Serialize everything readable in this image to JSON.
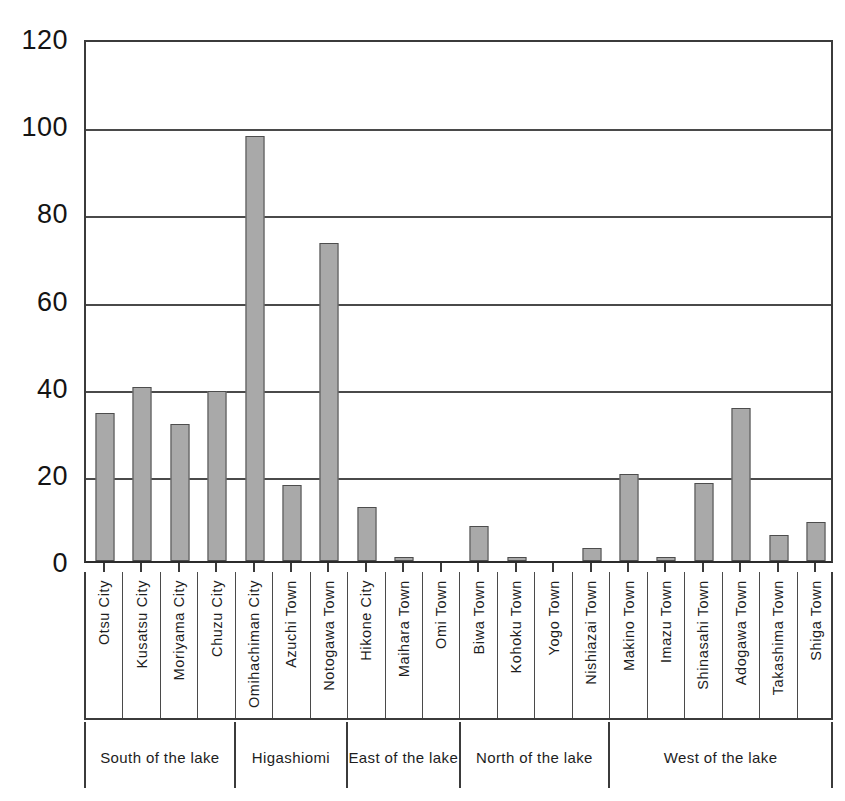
{
  "chart_data": {
    "type": "bar",
    "title": "",
    "subtitle": "",
    "xlabel": "",
    "ylabel": "",
    "ylim": [
      0,
      120
    ],
    "yticks": [
      0,
      20,
      40,
      60,
      80,
      100,
      120
    ],
    "ytick_labels": [
      "0",
      "20",
      "40",
      "60",
      "80",
      "100",
      "120"
    ],
    "grid": true,
    "legend": "none",
    "categories": [
      "Otsu City",
      "Kusatsu City",
      "Moriyama City",
      "Chuzu City",
      "Omihachiman City",
      "Azuchi Town",
      "Notogawa Town",
      "Hikone City",
      "Maihara Town",
      "Omi Town",
      "Biwa Town",
      "Kohoku Town",
      "Yogo Town",
      "Nishiazai Town",
      "Makino Town",
      "Imazu Town",
      "Shinasahi Town",
      "Adogawa Town",
      "Takashima Town",
      "Shiga Town"
    ],
    "values": [
      34,
      40,
      31.5,
      39,
      97.5,
      17.5,
      73,
      12.5,
      1,
      0,
      8,
      1,
      0,
      3,
      20,
      1,
      18,
      35,
      6,
      9
    ],
    "groups": [
      {
        "label": "South of the lake",
        "start": 0,
        "end": 3
      },
      {
        "label": "Higashiomi",
        "start": 4,
        "end": 6
      },
      {
        "label": "East of the lake",
        "start": 7,
        "end": 9
      },
      {
        "label": "North of the lake",
        "start": 10,
        "end": 13
      },
      {
        "label": "West of the lake",
        "start": 14,
        "end": 19
      }
    ],
    "colors": {
      "bar_fill": "#a9a9a9",
      "bar_stroke": "#4d4d4d",
      "axis": "#3b3b3b",
      "grid": "#4a4a4a",
      "background": "#ffffff",
      "text": "#1d1d1d"
    }
  }
}
